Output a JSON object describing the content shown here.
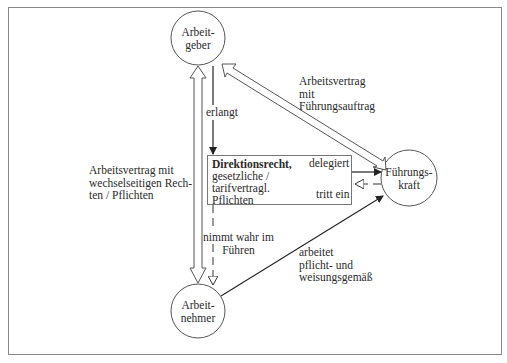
{
  "diagram": {
    "nodes": {
      "arbeitgeber": {
        "line1": "Arbeit-",
        "line2": "geber"
      },
      "fuehrungskraft": {
        "line1": "Führungs-",
        "line2": "kraft"
      },
      "arbeitnehmer": {
        "line1": "Arbeit-",
        "line2": "nehmer"
      }
    },
    "box": {
      "title": "Direktionsrecht,",
      "line2": "gesetzliche /",
      "line3": "tarifvertragl.",
      "line4": "Pflichten"
    },
    "edges": {
      "arbeitsvertrag_left": {
        "line1": "Arbeitsvertrag mit",
        "line2": "wechselseitigen Rech-",
        "line3": "ten / Pflichten"
      },
      "arbeitsvertrag_fk": {
        "line1": "Arbeitsvertrag",
        "line2": "mit",
        "line3": "Führungsauftrag"
      },
      "erlangt": "erlangt",
      "delegiert": "delegiert",
      "tritt_ein": "tritt ein",
      "nimmt_wahr": {
        "line1": "nimmt wahr im",
        "line2": "Führen"
      },
      "arbeitet": {
        "line1": "arbeitet",
        "line2": "pflicht- und",
        "line3": "weisungsgemäß"
      }
    },
    "colors": {
      "line": "#333333",
      "frame": "#8a8a8a",
      "background": "#ffffff"
    }
  }
}
